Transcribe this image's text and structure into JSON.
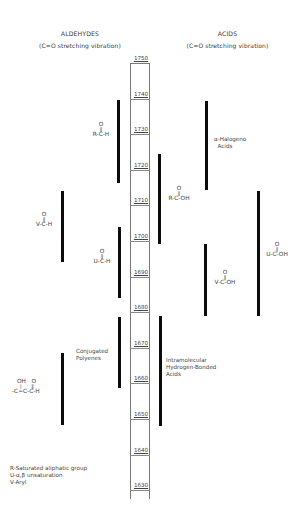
{
  "headers": {
    "aldehydes": {
      "title": "ALDEHYDES",
      "subtitle": "(C=O stretching vibration)"
    },
    "acids": {
      "title": "ACIDS",
      "subtitle": "(C=O stretching vibration)"
    }
  },
  "scale": {
    "unit_implied": "cm-1",
    "ticks": [
      "1750",
      "1740",
      "1730",
      "1720",
      "1710",
      "1700",
      "1690",
      "1680",
      "1670",
      "1660",
      "1650",
      "1640",
      "1630"
    ]
  },
  "aldehyde_ranges": [
    {
      "label": "R-C-H",
      "carbonyl": "O",
      "from": 1739,
      "to": 1715
    },
    {
      "label": "V-C-H",
      "carbonyl": "O",
      "from": 1714,
      "to": 1694
    },
    {
      "label": "U-C-H",
      "carbonyl": "O",
      "from": 1704,
      "to": 1684
    },
    {
      "label": "Conjugated\nPolyenes",
      "from": 1679,
      "to": 1659
    },
    {
      "label": "-C=C-C-H",
      "top_groups": "OH   O",
      "from": 1669,
      "to": 1648
    }
  ],
  "acid_ranges": [
    {
      "label": "α-Halogeno\n  Acids",
      "from": 1739,
      "to": 1714
    },
    {
      "label": "R-C-OH",
      "carbonyl": "O",
      "from": 1723,
      "to": 1699
    },
    {
      "label": "U-C-OH",
      "carbonyl": "O",
      "from": 1714,
      "to": 1680
    },
    {
      "label": "V-C-OH",
      "carbonyl": "O",
      "from": 1699,
      "to": 1678
    },
    {
      "label": "Intramolecular\nHydrogen-Bonded\nAcids",
      "from": 1680,
      "to": 1648
    }
  ],
  "legend": [
    "R-Saturated aliphatic group",
    "U-α,β unsaturation",
    "V-Aryl"
  ],
  "colors": {
    "bar": "#0c0c0c",
    "text": "#444444",
    "background": "#ffffff"
  }
}
